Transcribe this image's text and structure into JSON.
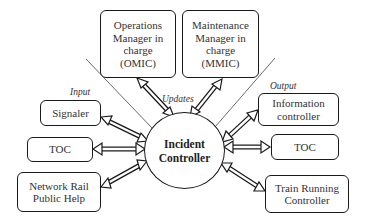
{
  "diagram": {
    "center_node": {
      "label": "Incident\nController"
    },
    "top_nodes": [
      {
        "id": "omic",
        "label": "Operations\nManager in\ncharge\n(OMIC)"
      },
      {
        "id": "mmic",
        "label": "Maintenance\nManager in\ncharge\n(MMIC)"
      }
    ],
    "input_nodes": [
      {
        "id": "signaler",
        "label": "Signaler"
      },
      {
        "id": "toc-in",
        "label": "TOC"
      },
      {
        "id": "network-rail",
        "label": "Network Rail\nPublic Help"
      }
    ],
    "output_nodes": [
      {
        "id": "info-controller",
        "label": "Information\ncontroller"
      },
      {
        "id": "toc-out",
        "label": "TOC"
      },
      {
        "id": "train-running",
        "label": "Train Running\nController"
      }
    ],
    "section_labels": {
      "input": "Input",
      "output": "Output",
      "updates": "Updates"
    },
    "edges": [
      {
        "from": "Incident Controller",
        "to": "OMIC",
        "type": "double-arrow"
      },
      {
        "from": "Incident Controller",
        "to": "MMIC",
        "type": "double-arrow"
      },
      {
        "from": "Signaler",
        "to": "Incident Controller",
        "type": "double-arrow"
      },
      {
        "from": "TOC",
        "to": "Incident Controller",
        "type": "double-arrow"
      },
      {
        "from": "Network Rail Public Help",
        "to": "Incident Controller",
        "type": "double-arrow"
      },
      {
        "from": "Incident Controller",
        "to": "Information controller",
        "type": "double-arrow"
      },
      {
        "from": "Incident Controller",
        "to": "TOC",
        "type": "double-arrow"
      },
      {
        "from": "Incident Controller",
        "to": "Train Running Controller",
        "type": "double-arrow"
      }
    ]
  }
}
